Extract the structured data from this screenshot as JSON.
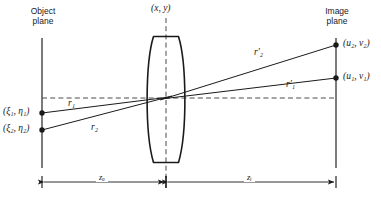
{
  "figure": {
    "type": "optical-ray-diagram",
    "background_color": "#ffffff",
    "line_color": "#1a1a1a"
  },
  "planes": {
    "object": {
      "label_line1": "Object",
      "label_line2": "plane",
      "x": 42,
      "y_top": 38,
      "y_bottom": 168
    },
    "image": {
      "label_line1": "Image",
      "label_line2": "plane",
      "x": 336,
      "y_top": 38,
      "y_bottom": 168
    }
  },
  "lens": {
    "center_x": 166,
    "top_y": 36,
    "bottom_y": 163,
    "half_width": 13,
    "axis_label": "(x, y)",
    "axis_label_x": 152,
    "axis_label_y": 4
  },
  "optical_axis": {
    "y": 98,
    "x_start": 42,
    "x_end": 336,
    "style": "dashed"
  },
  "object_points": [
    {
      "name": "object-point-1",
      "label": "(ξ₁, η₁)",
      "x": 42,
      "y": 113,
      "label_x": 3,
      "label_y": 107
    },
    {
      "name": "object-point-2",
      "label": "(ξ₂, η₂)",
      "x": 42,
      "y": 130,
      "label_x": 3,
      "label_y": 124
    }
  ],
  "image_points": [
    {
      "name": "image-point-2",
      "label": "(u₂, v₂)",
      "x": 336,
      "y": 45,
      "label_x": 342,
      "label_y": 39
    },
    {
      "name": "image-point-1",
      "label": "(u₁, v₁)",
      "x": 336,
      "y": 78,
      "label_x": 342,
      "label_y": 72
    }
  ],
  "rays": [
    {
      "name": "ray-r1-object-side",
      "label": "r₁",
      "label_x": 70,
      "label_y": 103,
      "from_x": 42,
      "from_y": 113,
      "to_x": 166,
      "to_y": 98
    },
    {
      "name": "ray-r2-object-side",
      "label": "r₂",
      "label_x": 93,
      "label_y": 126,
      "from_x": 42,
      "from_y": 130,
      "to_x": 166,
      "to_y": 98
    },
    {
      "name": "ray-r1-prime-image-side",
      "label": "r′₁",
      "label_x": 287,
      "label_y": 84,
      "from_x": 166,
      "from_y": 98,
      "to_x": 336,
      "to_y": 78
    },
    {
      "name": "ray-r2-prime-image-side",
      "label": "r′₂",
      "label_x": 255,
      "label_y": 51,
      "from_x": 166,
      "from_y": 98,
      "to_x": 336,
      "to_y": 45
    }
  ],
  "dimensions": [
    {
      "name": "object-distance",
      "label": "zₒ",
      "label_x": 99,
      "label_y": 174,
      "x_start": 42,
      "x_end": 166,
      "y": 182
    },
    {
      "name": "image-distance",
      "label": "zᵢ",
      "label_x": 247,
      "label_y": 174,
      "x_start": 166,
      "x_end": 336,
      "y": 182
    }
  ]
}
